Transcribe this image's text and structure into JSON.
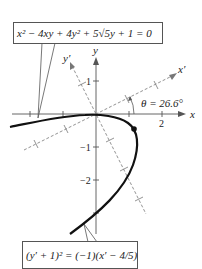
{
  "equations": {
    "original": "x² − 4xy + 4y² + 5√5y + 1 = 0",
    "rotated": "(y′ + 1)² = (−1)(x′ − 4/5)"
  },
  "axes": {
    "x_label": "x",
    "y_label": "y",
    "x_prime_label": "x′",
    "y_prime_label": "y′",
    "x_tick_labels": [
      "2"
    ],
    "y_tick_labels": [
      "1",
      "−1",
      "−2"
    ]
  },
  "angle_label": "θ = 26.6°",
  "colors": {
    "curve": "#111111",
    "axes": "#555555",
    "rotated_axes": "#777777"
  }
}
